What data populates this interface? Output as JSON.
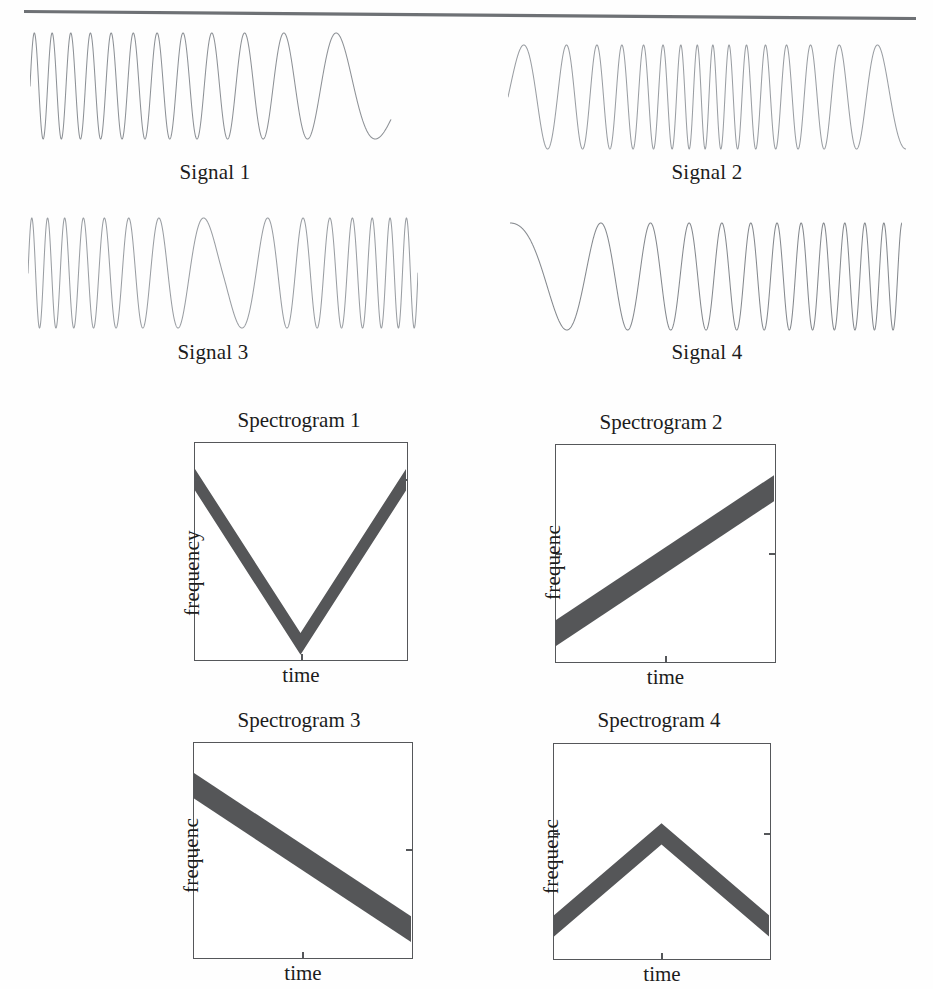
{
  "page": {
    "background_color": "#fefefe",
    "ink_color": "#1c1c1c",
    "rule_color": "#6e7175",
    "trace_color": "#8d9196",
    "band_color": "#555658",
    "axis_color": "#55575a"
  },
  "divider": {
    "name": "horizontal-rule"
  },
  "signals": [
    {
      "id": "signal-1",
      "caption": "Signal 1",
      "chirp": "descending",
      "f_start": 22.5,
      "f_end": 1.6,
      "phase": 0.0,
      "trim_end": 0.93
    },
    {
      "id": "signal-2",
      "caption": "Signal 2",
      "chirp": "v-up-down",
      "f_start": 5.5,
      "f_mid": 26.0,
      "f_end": 5.5,
      "phase": 0.0,
      "trim_end": 1.0
    },
    {
      "id": "signal-3",
      "caption": "Signal 3",
      "chirp": "v-down-up",
      "f_start": 26.0,
      "f_mid": 4.0,
      "f_end": 26.0,
      "phase": 0.0,
      "trim_end": 1.0
    },
    {
      "id": "signal-4",
      "caption": "Signal 4",
      "chirp": "ascending",
      "f_start": 2.0,
      "f_end": 22.0,
      "phase": 0.25,
      "trim_end": 1.0
    }
  ],
  "spectrograms": [
    {
      "id": "spectrogram-1",
      "title": "Spectrogram 1",
      "ylabel": "frequency",
      "xlabel": "time",
      "shape": "v",
      "points": [
        [
          0.0,
          0.83
        ],
        [
          0.5,
          0.07
        ],
        [
          1.0,
          0.83
        ]
      ],
      "band_thickness": 0.1,
      "yticks": [
        0.83
      ],
      "xticks": [
        0.5
      ]
    },
    {
      "id": "spectrogram-2",
      "title": "Spectrogram 2",
      "ylabel": "frequenc",
      "xlabel": "time",
      "shape": "ramp-up",
      "points": [
        [
          0.0,
          0.13
        ],
        [
          1.0,
          0.8
        ]
      ],
      "band_thickness": 0.12,
      "yticks": [
        0.52
      ],
      "xticks": [
        0.5
      ]
    },
    {
      "id": "spectrogram-3",
      "title": "Spectrogram 3",
      "ylabel": "frequenc",
      "xlabel": "time",
      "shape": "ramp-down",
      "points": [
        [
          0.0,
          0.8
        ],
        [
          1.0,
          0.13
        ]
      ],
      "band_thickness": 0.12,
      "yticks": [
        0.52
      ],
      "xticks": [
        0.5
      ]
    },
    {
      "id": "spectrogram-4",
      "title": "Spectrogram 4",
      "ylabel": "frequenc",
      "xlabel": "time",
      "shape": "lambda",
      "points": [
        [
          0.0,
          0.15
        ],
        [
          0.5,
          0.58
        ],
        [
          1.0,
          0.15
        ]
      ],
      "band_thickness": 0.1,
      "yticks": [
        0.58
      ],
      "xticks": [
        0.5
      ]
    }
  ],
  "chart_data": {
    "type": "line",
    "title": "",
    "xlabel": "time",
    "ylabel": "frequency",
    "series": [
      {
        "name": "Signal 1",
        "kind": "waveform",
        "instantaneous_frequency": {
          "start": 22.5,
          "end": 1.6,
          "profile": "linear-descending"
        }
      },
      {
        "name": "Signal 2",
        "kind": "waveform",
        "instantaneous_frequency": {
          "start": 5.5,
          "middle": 26.0,
          "end": 5.5,
          "profile": "v-up-then-down"
        }
      },
      {
        "name": "Signal 3",
        "kind": "waveform",
        "instantaneous_frequency": {
          "start": 26.0,
          "middle": 4.0,
          "end": 26.0,
          "profile": "v-down-then-up"
        }
      },
      {
        "name": "Signal 4",
        "kind": "waveform",
        "instantaneous_frequency": {
          "start": 2.0,
          "end": 22.0,
          "profile": "linear-ascending"
        }
      },
      {
        "name": "Spectrogram 1",
        "kind": "spectrogram-ridge",
        "x": [
          0.0,
          0.5,
          1.0
        ],
        "y": [
          0.83,
          0.07,
          0.83
        ]
      },
      {
        "name": "Spectrogram 2",
        "kind": "spectrogram-ridge",
        "x": [
          0.0,
          1.0
        ],
        "y": [
          0.13,
          0.8
        ]
      },
      {
        "name": "Spectrogram 3",
        "kind": "spectrogram-ridge",
        "x": [
          0.0,
          1.0
        ],
        "y": [
          0.8,
          0.13
        ]
      },
      {
        "name": "Spectrogram 4",
        "kind": "spectrogram-ridge",
        "x": [
          0.0,
          0.5,
          1.0
        ],
        "y": [
          0.15,
          0.58,
          0.15
        ]
      }
    ],
    "xlim": [
      0,
      1
    ],
    "ylim": [
      0,
      1
    ],
    "grid": false,
    "legend": "none"
  }
}
